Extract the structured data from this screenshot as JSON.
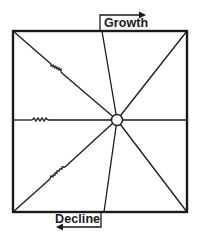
{
  "diagram": {
    "labels": {
      "top": "Growth",
      "bottom": "Decline"
    },
    "colors": {
      "stroke": "#1a1a1a",
      "background": "#ffffff"
    },
    "box": {
      "x1": 13,
      "y1": 31,
      "x2": 187,
      "y2": 212
    },
    "center": {
      "x": 117,
      "y": 120,
      "r": 5
    },
    "spokes": [
      {
        "name": "top-left",
        "x": 13,
        "y": 31,
        "zigzag": true
      },
      {
        "name": "top",
        "x": 102,
        "y": 31,
        "zigzag": false
      },
      {
        "name": "top-right",
        "x": 187,
        "y": 31,
        "zigzag": false
      },
      {
        "name": "right",
        "x": 187,
        "y": 120,
        "zigzag": false
      },
      {
        "name": "bottom-right",
        "x": 187,
        "y": 212,
        "zigzag": false
      },
      {
        "name": "bottom",
        "x": 104,
        "y": 212,
        "zigzag": false
      },
      {
        "name": "bottom-left",
        "x": 13,
        "y": 212,
        "zigzag": true
      },
      {
        "name": "left",
        "x": 13,
        "y": 120,
        "zigzag": true
      }
    ]
  }
}
